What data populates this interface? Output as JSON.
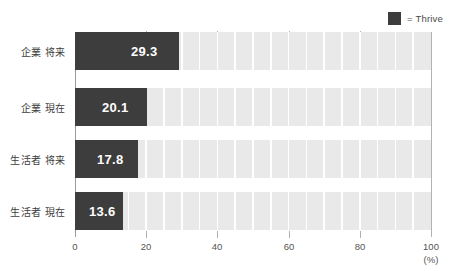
{
  "legend": {
    "swatch_color": "#3d3d3d",
    "label": "= Thrive"
  },
  "colors": {
    "bar": "#3d3d3d",
    "track": "#e9e9e9",
    "axis": "#9a9a9a",
    "background": "#ffffff",
    "value_text": "#ffffff"
  },
  "axis": {
    "unit": "(%)",
    "ticks": [
      "0",
      "20",
      "40",
      "60",
      "80",
      "100"
    ]
  },
  "categories": [
    {
      "label": "企業 将来",
      "value_text": "29.3"
    },
    {
      "label": "企業 現在",
      "value_text": "20.1"
    },
    {
      "label": "生活者 将来",
      "value_text": "17.8"
    },
    {
      "label": "生活者 現在",
      "value_text": "13.6"
    }
  ],
  "chart_data": {
    "type": "bar",
    "orientation": "horizontal",
    "title": "",
    "subtitle": "",
    "xlabel": "(%)",
    "ylabel": "",
    "categories": [
      "企業 将来",
      "企業 現在",
      "生活者 将来",
      "生活者 現在"
    ],
    "values": [
      29.3,
      20.1,
      17.8,
      13.6
    ],
    "series": [
      {
        "name": "Thrive",
        "values": [
          29.3,
          20.1,
          17.8,
          13.6
        ],
        "color": "#3d3d3d"
      }
    ],
    "xlim": [
      0,
      100
    ],
    "xticks": [
      0,
      20,
      40,
      60,
      80,
      100
    ],
    "ticklabels": [
      "0",
      "20",
      "40",
      "60",
      "80",
      "100"
    ],
    "grid": false,
    "legend": {
      "position": "top-right",
      "entries": [
        "= Thrive"
      ]
    },
    "track_max": 100,
    "track_color": "#e9e9e9",
    "data_labels": [
      "29.3",
      "20.1",
      "17.8",
      "13.6"
    ],
    "annotations": []
  }
}
